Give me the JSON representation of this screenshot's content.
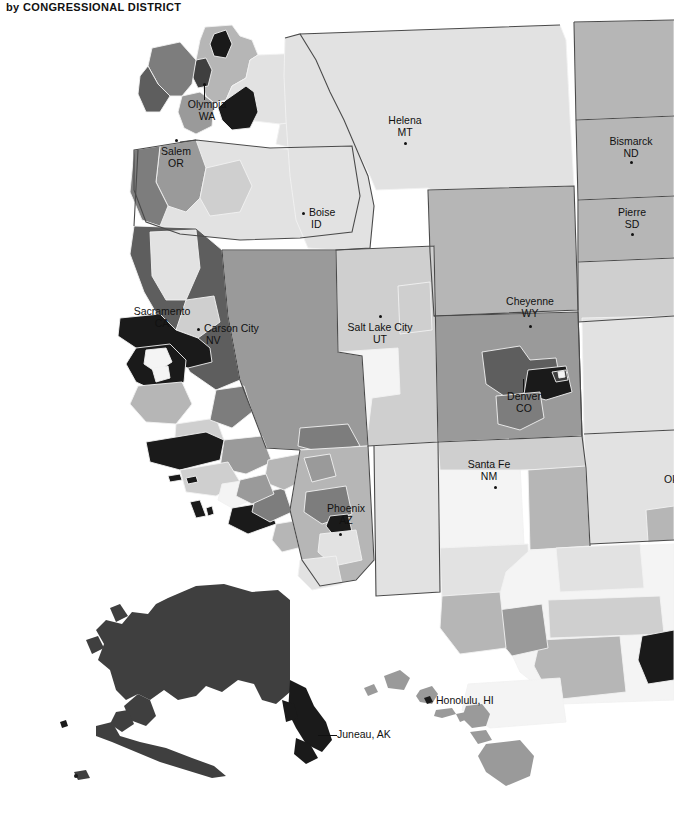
{
  "header": {
    "title": "by CONGRESSIONAL DISTRICT",
    "title_lead": "by",
    "title_main": "CONGRESSIONAL DISTRICT"
  },
  "map": {
    "name": "western-united-states-congressional-districts",
    "projection": "albers-usa",
    "width": 674,
    "height": 824,
    "background": "#ffffff",
    "border_color": "#4a4a4a",
    "district_border_color": "#f2f2f2",
    "insets": [
      "Alaska",
      "Hawaii"
    ],
    "palette": {
      "class_1": "#f4f4f4",
      "class_2": "#e2e2e2",
      "class_3": "#cfcfcf",
      "class_4": "#b6b6b6",
      "class_5": "#9a9a9a",
      "class_6": "#7d7d7d",
      "class_7": "#5e5e5e",
      "class_8": "#3f3f3f",
      "class_9": "#1a1a1a",
      "water": "#ffffff"
    }
  },
  "cities": [
    {
      "name": "Olympia",
      "state": "WA",
      "label_style": "ctr",
      "x": 207,
      "y": 100,
      "dot_x": 204,
      "dot_y": 84,
      "leader": {
        "x": 204,
        "y": 84,
        "h": 16
      }
    },
    {
      "name": "Salem",
      "state": "OR",
      "label_style": "ctr",
      "x": 176,
      "y": 148,
      "dot_x": 176,
      "dot_y": 140,
      "leader": null
    },
    {
      "name": "Helena",
      "state": "MT",
      "label_style": "ctr",
      "x": 405,
      "y": 120,
      "dot_x": 405,
      "dot_y": 144,
      "leader": null
    },
    {
      "name": "Boise",
      "state": "ID",
      "label_style": "lft",
      "x": 310,
      "y": 209,
      "dot_x": 303,
      "dot_y": 213,
      "leader": null
    },
    {
      "name": "Bismarck",
      "state": "ND",
      "label_style": "ctr",
      "x": 630,
      "y": 141,
      "dot_x": 630,
      "dot_y": 162,
      "leader": null
    },
    {
      "name": "Pierre",
      "state": "SD",
      "label_style": "ctr",
      "x": 631,
      "y": 212,
      "dot_x": 631,
      "dot_y": 234,
      "leader": null
    },
    {
      "name": "Sacramento",
      "state": "CA",
      "label_style": "ctr",
      "x": 161,
      "y": 311,
      "dot_x": 152,
      "dot_y": 333,
      "leader": null
    },
    {
      "name": "Carson City",
      "state": "NV",
      "label_style": "lft",
      "x": 205,
      "y": 325,
      "dot_x": 198,
      "dot_y": 329,
      "leader": null
    },
    {
      "name": "Salt Lake City",
      "state": "UT",
      "label_style": "ctr",
      "x": 380,
      "y": 325,
      "dot_x": 380,
      "dot_y": 316,
      "leader": null
    },
    {
      "name": "Cheyenne",
      "state": "WY",
      "label_style": "ctr",
      "x": 529,
      "y": 301,
      "dot_x": 529,
      "dot_y": 326,
      "leader": null
    },
    {
      "name": "Denver",
      "state": "CO",
      "label_style": "ctr",
      "x": 523,
      "y": 396,
      "dot_x": 523,
      "dot_y": 380,
      "leader": {
        "x": 523,
        "y": 380,
        "h": 14
      }
    },
    {
      "name": "Santa Fe",
      "state": "NM",
      "label_style": "ctr",
      "x": 488,
      "y": 464,
      "dot_x": 495,
      "dot_y": 487,
      "leader": null
    },
    {
      "name": "Phoenix",
      "state": "AZ",
      "label_style": "ctr",
      "x": 345,
      "y": 508,
      "dot_x": 340,
      "dot_y": 534,
      "leader": null
    }
  ],
  "inline_labels": [
    {
      "name": "Juneau, AK",
      "x": 337,
      "y": 732,
      "leader": {
        "x1": 318,
        "y1": 735,
        "x2": 337,
        "y2": 735
      }
    },
    {
      "name": "Honolulu, HI",
      "x": 436,
      "y": 698,
      "leader": null
    }
  ],
  "edge_labels": [
    {
      "name": "Ok",
      "full": "Oklahoma City, OK",
      "x": 665,
      "y": 480,
      "clipped": true
    }
  ]
}
